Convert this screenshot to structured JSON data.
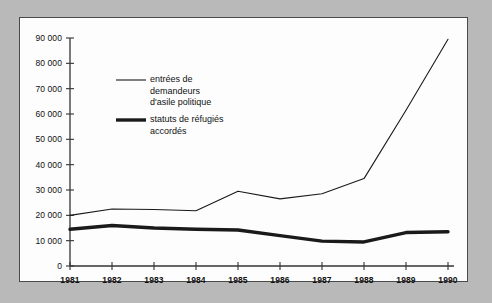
{
  "chart_data": {
    "type": "line",
    "title": "",
    "xlabel": "",
    "ylabel": "",
    "x": [
      1981,
      1982,
      1983,
      1984,
      1985,
      1986,
      1987,
      1988,
      1989,
      1990
    ],
    "categories": [
      "1981",
      "1982",
      "1983",
      "1984",
      "1985",
      "1986",
      "1987",
      "1988",
      "1989",
      "1990"
    ],
    "series": [
      {
        "name": "entrées de demandeurs d'asile politique",
        "style": "thin",
        "values": [
          20000,
          22500,
          22300,
          21800,
          29500,
          26500,
          28500,
          34500,
          61500,
          89500
        ]
      },
      {
        "name": "statuts de réfugiés accordés",
        "style": "thick",
        "values": [
          14500,
          16000,
          15000,
          14500,
          14200,
          12000,
          9800,
          9500,
          13200,
          13500
        ]
      }
    ],
    "ylim": [
      0,
      90000
    ],
    "yticks": [
      0,
      10000,
      20000,
      30000,
      40000,
      50000,
      60000,
      70000,
      80000,
      90000
    ],
    "ytick_labels": [
      "0",
      "10 000",
      "20 000",
      "30 000",
      "40 000",
      "50 000",
      "60 000",
      "70 000",
      "80 000",
      "90 000"
    ],
    "xlim": [
      1981,
      1990
    ],
    "grid": false,
    "legend_position": "inside-top-left",
    "legend": [
      {
        "line_style": "thin",
        "lines": [
          "entrées de",
          "demandeurs",
          "d'asile politique"
        ]
      },
      {
        "line_style": "thick",
        "lines": [
          "statuts de réfugiés",
          "accordés"
        ]
      }
    ],
    "colors": {
      "line": "#1a1a1a",
      "axis": "#333333",
      "panel_background": "#fdfdfd",
      "page_background": "#b9b9b9",
      "text": "#111111"
    }
  }
}
